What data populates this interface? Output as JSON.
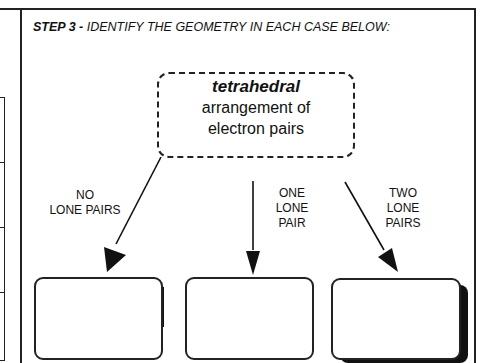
{
  "header": {
    "step_label": "STEP 3 -",
    "instruction": " IDENTIFY THE GEOMETRY IN EACH CASE BELOW:"
  },
  "concept_box": {
    "keyword": "tetrahedral",
    "line2": "arrangement of",
    "line3": "electron pairs"
  },
  "branches": [
    {
      "label_lines": [
        "NO",
        "LONE PAIRS"
      ],
      "answer": ""
    },
    {
      "label_lines": [
        "ONE",
        "LONE",
        "PAIR"
      ],
      "answer": ""
    },
    {
      "label_lines": [
        "TWO",
        "LONE",
        "PAIRS"
      ],
      "answer": ""
    }
  ],
  "colors": {
    "ink": "#111111",
    "background": "#ffffff"
  }
}
